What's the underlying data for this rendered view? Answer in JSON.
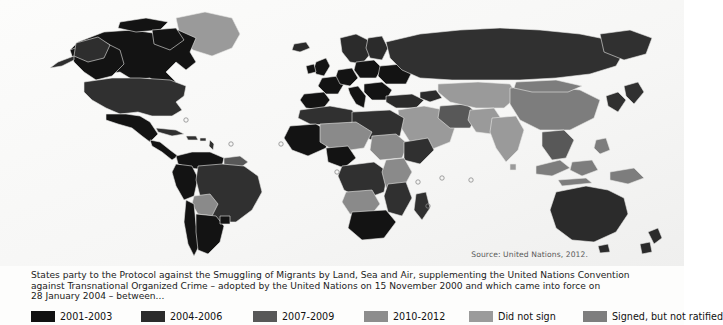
{
  "map": {
    "title": "world-choropleth-smuggling-of-migrants-protocol",
    "source_note": "Source: United Nations, 2012.",
    "background_color": "#fbfbfa",
    "border_color": "#d8d8d6",
    "categories": [
      {
        "key": "2001-2003",
        "color": "#111111"
      },
      {
        "key": "2004-2006",
        "color": "#2e2e2e"
      },
      {
        "key": "2007-2009",
        "color": "#555555"
      },
      {
        "key": "2010-2012",
        "color": "#8a8a8a"
      },
      {
        "key": "Did not sign",
        "color": "#9a9a9a"
      },
      {
        "key": "Signed, but not ratified",
        "color": "#7d7d7d"
      }
    ],
    "regions": [
      {
        "name": "canada",
        "category": "2001-2003"
      },
      {
        "name": "greenland",
        "category": "did-not-sign"
      },
      {
        "name": "united-states",
        "category": "2004-2006"
      },
      {
        "name": "mexico",
        "category": "2001-2003"
      },
      {
        "name": "central-america",
        "category": "2001-2003"
      },
      {
        "name": "caribbean-islands",
        "category": "2004-2006"
      },
      {
        "name": "colombia-venezuela",
        "category": "2001-2003"
      },
      {
        "name": "guyanas",
        "category": "2007-2009"
      },
      {
        "name": "peru",
        "category": "2001-2003"
      },
      {
        "name": "brazil",
        "category": "2004-2006"
      },
      {
        "name": "bolivia",
        "category": "2007-2009"
      },
      {
        "name": "chile-argentina",
        "category": "2001-2003"
      },
      {
        "name": "north-africa",
        "category": "2004-2006"
      },
      {
        "name": "west-africa",
        "category": "2001-2003"
      },
      {
        "name": "sahel",
        "category": "2007-2009"
      },
      {
        "name": "nigeria",
        "category": "2001-2003"
      },
      {
        "name": "central-africa",
        "category": "2004-2006"
      },
      {
        "name": "east-africa",
        "category": "2007-2009"
      },
      {
        "name": "southern-africa",
        "category": "2001-2003"
      },
      {
        "name": "madagascar",
        "category": "2004-2006"
      },
      {
        "name": "western-europe",
        "category": "2001-2003"
      },
      {
        "name": "scandinavia",
        "category": "2004-2006"
      },
      {
        "name": "eastern-europe",
        "category": "2001-2003"
      },
      {
        "name": "russia",
        "category": "2004-2006"
      },
      {
        "name": "turkey",
        "category": "2004-2006"
      },
      {
        "name": "middle-east",
        "category": "did-not-sign"
      },
      {
        "name": "central-asia",
        "category": "did-not-sign"
      },
      {
        "name": "india",
        "category": "did-not-sign"
      },
      {
        "name": "china",
        "category": "signed-not-ratified"
      },
      {
        "name": "southeast-asia",
        "category": "2007-2009"
      },
      {
        "name": "indonesia",
        "category": "signed-not-ratified"
      },
      {
        "name": "papua-new-guinea",
        "category": "signed-not-ratified"
      },
      {
        "name": "australia",
        "category": "2004-2006"
      },
      {
        "name": "new-zealand",
        "category": "2004-2006"
      }
    ]
  },
  "caption": {
    "line1": "States party to the Protocol against the Smuggling of Migrants by Land, Sea and Air, supplementing the United Nations Convention",
    "line2": "against Transnational Organized Crime – adopted by the United Nations on 15 November 2000 and which came into force on",
    "line3": "28 January 2004 – between..."
  },
  "legend": {
    "items": [
      {
        "label": "2001-2003",
        "color": "#111111"
      },
      {
        "label": "2004-2006",
        "color": "#2b2b2b"
      },
      {
        "label": "2007-2009",
        "color": "#585858"
      },
      {
        "label": "2010-2012",
        "color": "#8d8d8d"
      },
      {
        "label": "Did not sign",
        "color": "#9b9b9b"
      },
      {
        "label": "Signed, but not ratified",
        "color": "#7e7e7e"
      }
    ]
  }
}
